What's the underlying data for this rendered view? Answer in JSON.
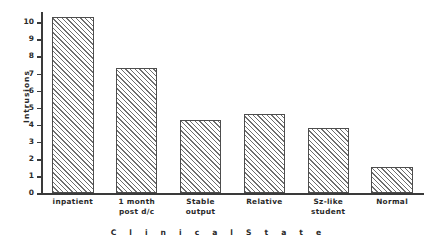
{
  "chart_data": {
    "type": "bar",
    "title": "",
    "xlabel": "C l i n i c a l   S t a t e",
    "ylabel": "Intrusions",
    "categories": [
      "inpatient",
      "1 month post d/c",
      "Stable output",
      "Relative",
      "Sz-like student",
      "Normal"
    ],
    "category_lines": [
      [
        "inpatient"
      ],
      [
        "1 month",
        "post d/c"
      ],
      [
        "Stable",
        "output"
      ],
      [
        "Relative"
      ],
      [
        "Sz-like",
        "student"
      ],
      [
        "Normal"
      ]
    ],
    "values": [
      10.3,
      7.3,
      4.3,
      4.65,
      3.85,
      1.55
    ],
    "ylim": [
      0,
      10.6
    ],
    "yticks": [
      0,
      1,
      2,
      3,
      4,
      5,
      6,
      7,
      8,
      9,
      10
    ],
    "ytick_labels": [
      "0",
      "1",
      "2",
      "3",
      "4",
      "5",
      "6",
      "7",
      "8",
      "9",
      "10"
    ],
    "grid": false,
    "legend": false,
    "bar_fill": "hatched-diagonal",
    "bar_edge_color": "#4d4d4d",
    "hatch_color": "#6e6e6e",
    "axis_color": "#3a3a3a",
    "background": "#ffffff"
  },
  "figure": {
    "caption": ""
  }
}
